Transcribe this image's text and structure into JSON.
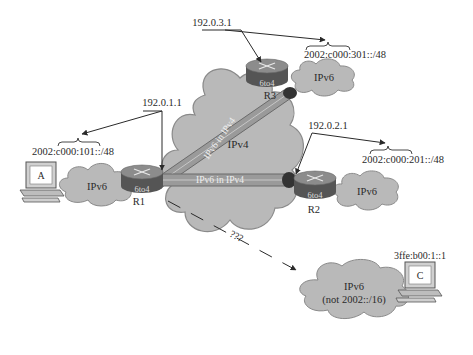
{
  "colors": {
    "cloud_fill": "#b9b9b9",
    "cloud_stroke": "#8a8a8a",
    "router_top": "#8c8c8c",
    "router_side": "#555555",
    "tunnel_fill": "#9a9a9a",
    "tunnel_edge": "#6a6a6a",
    "text": "#2a2a2a"
  },
  "clouds": {
    "ipv4_core": {
      "label": "IPv4"
    },
    "ipv6_site_a": {
      "label": "IPv6"
    },
    "ipv6_site_r2": {
      "label": "IPv6"
    },
    "ipv6_site_r3": {
      "label": "IPv6"
    },
    "ipv6_native": {
      "label": "IPv6",
      "sublabel": "(not 2002::/16)"
    }
  },
  "routers": {
    "r1": {
      "name": "R1",
      "type": "6to4",
      "ipv4": "192.0.1.1",
      "prefix": "2002:c000:101::/48"
    },
    "r2": {
      "name": "R2",
      "type": "6to4",
      "ipv4": "192.0.2.1",
      "prefix": "2002:c000:201::/48"
    },
    "r3": {
      "name": "R3",
      "type": "6to4",
      "ipv4": "192.0.3.1",
      "prefix": "2002:c000:301::/48"
    }
  },
  "tunnels": {
    "r1_r3": {
      "label": "IPv6 in IPv4"
    },
    "r1_r2": {
      "label": "IPv6 in IPv4"
    }
  },
  "hosts": {
    "a": {
      "label": "A"
    },
    "c": {
      "label": "C",
      "address": "3ffe:b00:1::1"
    }
  },
  "unknown_path": {
    "label": "???"
  }
}
